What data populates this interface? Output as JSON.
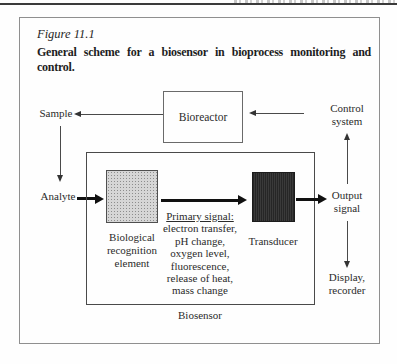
{
  "figure": {
    "label": "Figure 11.1",
    "caption_line1": "General scheme for a biosensor in bioprocess monitoring and",
    "caption_line2": "control."
  },
  "diagram": {
    "nodes": {
      "bioreactor": "Bioreactor",
      "biological_recognition_element": "Biological recognition element",
      "transducer": "Transducer",
      "biosensor": "Biosensor"
    },
    "labels": {
      "sample": "Sample",
      "analyte": "Analyte",
      "output_signal": "Output signal",
      "control_system": "Control system",
      "display_recorder": "Display, recorder"
    },
    "primary_signal": {
      "heading": "Primary signal:",
      "items": [
        "electron transfer,",
        "pH change,",
        "oxygen level,",
        "fluorescence,",
        "release of heat,",
        "mass change"
      ]
    },
    "colors": {
      "transducer_fill": "#2f2f2f",
      "recognition_fill": "#d6d6d6",
      "box_border_gray": "#6a6a6a",
      "biosensor_border": "#4a4a4a",
      "arrow_black": "#111111",
      "text": "#2b2b2b"
    }
  }
}
